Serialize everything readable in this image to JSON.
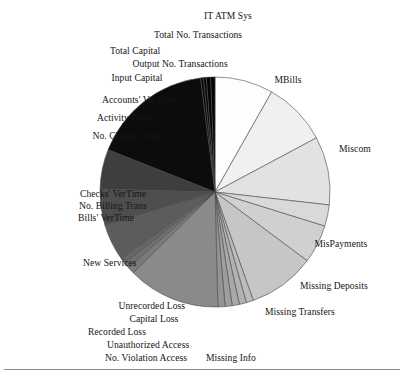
{
  "figure": {
    "background_color": "#ffffff",
    "text_color": "#151515",
    "stroke_color": "#4a4a4a",
    "has_footer_rule": true
  },
  "chart_data": {
    "type": "pie",
    "title": "",
    "xlabel": "",
    "ylabel": "",
    "legend_position": "none",
    "labels_position": "outside",
    "start_angle_deg": 0,
    "direction": "clockwise",
    "center": {
      "x": 215,
      "y": 192
    },
    "radius": 115,
    "categories": [
      "MBills",
      "Miscom",
      "MisPayments",
      "Missing Deposits",
      "Missing Transfers",
      "Missing Info",
      "No.  Violation Access",
      "Unauthorized Access",
      "Recorded Loss",
      "Capital Loss",
      "Unrecorded Loss",
      "New Services",
      "Bills' VerTime",
      "No. Billing Trans",
      "Checks' VerTime",
      "No. Checks' Trans",
      "Activity Time",
      "Accounts' VerTime",
      "Input Capital",
      "Output No. Transactions",
      "Total Capital",
      "Total No. Transactions",
      "IT ATM Sys"
    ],
    "values": [
      8.2,
      9.0,
      9.6,
      3.0,
      5.4,
      9.4,
      1.0,
      1.0,
      1.0,
      1.0,
      1.0,
      13.0,
      1.0,
      0.8,
      0.8,
      5.2,
      5.0,
      5.6,
      17.0,
      0.4,
      0.4,
      0.6,
      0.6
    ],
    "colors": [
      "#fdfdfd",
      "#f0f0f0",
      "#e2e2e2",
      "#d9d9d9",
      "#d0d0d0",
      "#c6c6c6",
      "#bcbcbc",
      "#b2b2b2",
      "#a8a8a8",
      "#9e9e9e",
      "#949494",
      "#8a8a8a",
      "#7a7a7a",
      "#707070",
      "#666666",
      "#5c5c5c",
      "#4e4e4e",
      "#3e3e3e",
      "#0c0c0c",
      "#090909",
      "#070707",
      "#050505",
      "#030303"
    ]
  },
  "labels": [
    {
      "name": "it-atm-sys",
      "text": "IT ATM Sys",
      "x": 228,
      "y": 10,
      "align": "center"
    },
    {
      "name": "total-no-transactions",
      "text": "Total No. Transactions",
      "x": 198,
      "y": 29,
      "align": "center"
    },
    {
      "name": "total-capital",
      "text": "Total Capital",
      "x": 135,
      "y": 45,
      "align": "center"
    },
    {
      "name": "output-no-transactions",
      "text": "Output No. Transactions",
      "x": 180,
      "y": 58,
      "align": "center"
    },
    {
      "name": "input-capital",
      "text": "Input Capital",
      "x": 137,
      "y": 72,
      "align": "center"
    },
    {
      "name": "accounts-vertime",
      "text": "Accounts' VerTime",
      "x": 139,
      "y": 94,
      "align": "center"
    },
    {
      "name": "activity-time",
      "text": "Activity Time",
      "x": 124,
      "y": 112,
      "align": "center"
    },
    {
      "name": "no-checks-trans",
      "text": "No. Checks' Trans",
      "x": 128,
      "y": 130,
      "align": "center"
    },
    {
      "name": "checks-vertime",
      "text": "Checks' VerTime",
      "x": 113,
      "y": 188,
      "align": "center"
    },
    {
      "name": "no-billing-trans",
      "text": "No. Billing Trans",
      "x": 113,
      "y": 200,
      "align": "center"
    },
    {
      "name": "bills-vertime",
      "text": "Bills' VerTime",
      "x": 106,
      "y": 212,
      "align": "center"
    },
    {
      "name": "new-services",
      "text": "New Services",
      "x": 110,
      "y": 257,
      "align": "center"
    },
    {
      "name": "unrecorded-loss",
      "text": "Unrecorded Loss",
      "x": 152,
      "y": 300,
      "align": "center"
    },
    {
      "name": "capital-loss",
      "text": "Capital Loss",
      "x": 154,
      "y": 313,
      "align": "center"
    },
    {
      "name": "recorded-loss",
      "text": "Recorded Loss",
      "x": 117,
      "y": 326,
      "align": "center"
    },
    {
      "name": "unauthorized-access",
      "text": "Unauthorized Access",
      "x": 148,
      "y": 339,
      "align": "center"
    },
    {
      "name": "no-violation-access",
      "text": "No.  Violation Access",
      "x": 146,
      "y": 352,
      "align": "center"
    },
    {
      "name": "missing-info",
      "text": "Missing Info",
      "x": 231,
      "y": 352,
      "align": "center"
    },
    {
      "name": "missing-transfers",
      "text": "Missing Transfers",
      "x": 300,
      "y": 306,
      "align": "center"
    },
    {
      "name": "missing-deposits",
      "text": "Missing Deposits",
      "x": 334,
      "y": 280,
      "align": "center"
    },
    {
      "name": "mispayments",
      "text": "MisPayments",
      "x": 341,
      "y": 238,
      "align": "center"
    },
    {
      "name": "miscom",
      "text": "Miscom",
      "x": 355,
      "y": 143,
      "align": "center"
    },
    {
      "name": "mbills",
      "text": "MBills",
      "x": 288,
      "y": 74,
      "align": "center"
    }
  ]
}
